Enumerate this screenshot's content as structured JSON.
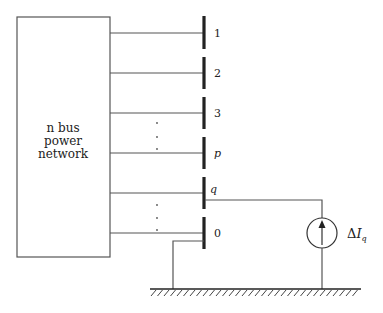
{
  "diagram": {
    "network_box": {
      "label_lines": [
        "n bus",
        "power",
        "network"
      ]
    },
    "buses": [
      {
        "id": "bus-1",
        "label": "1",
        "y": 33
      },
      {
        "id": "bus-2",
        "label": "2",
        "y": 73
      },
      {
        "id": "bus-3",
        "label": "3",
        "y": 113
      },
      {
        "id": "bus-p",
        "label": "p",
        "y": 153,
        "italic": true
      },
      {
        "id": "bus-q",
        "label": "q",
        "y": 193,
        "italic": true
      },
      {
        "id": "bus-0",
        "label": "0",
        "y": 233
      }
    ],
    "ellipsis_dots": [
      "·",
      "·",
      "·"
    ],
    "current_source": {
      "label_delta": "Δ",
      "label_var": "I",
      "label_sub": "q"
    },
    "colors": {
      "line": "#555555",
      "bus_bar": "#222222",
      "text": "#222222"
    }
  }
}
